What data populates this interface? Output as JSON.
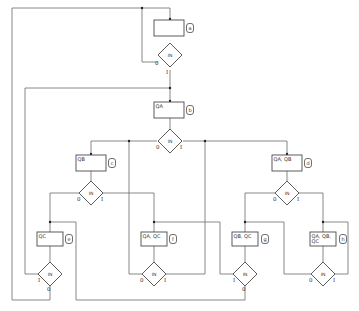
{
  "diagram": {
    "type": "ASM chart",
    "input_label": "IN",
    "states": [
      {
        "id": "a",
        "tag": "a",
        "outputs": [
          ""
        ],
        "box": [
          154,
          20,
          30,
          16
        ],
        "tagpos": [
          190,
          28
        ],
        "decision": [
          170,
          55
        ]
      },
      {
        "id": "b",
        "tag": "b",
        "outputs": [
          "QA"
        ],
        "box": [
          154,
          102,
          30,
          16
        ],
        "tagpos": [
          190,
          110
        ],
        "decision": [
          170,
          141
        ]
      },
      {
        "id": "c",
        "tag": "c",
        "outputs": [
          "QB"
        ],
        "box": [
          76,
          155,
          30,
          16
        ],
        "tagpos": [
          112,
          163
        ],
        "decision": [
          91,
          193
        ]
      },
      {
        "id": "d",
        "tag": "d",
        "outputs": [
          "QA, QB"
        ],
        "box": [
          272,
          155,
          30,
          16
        ],
        "tagpos": [
          308,
          163
        ],
        "decision": [
          287,
          193
        ]
      },
      {
        "id": "e",
        "tag": "e",
        "outputs": [
          "QC"
        ],
        "box": [
          37,
          232,
          26,
          14
        ],
        "tagpos": [
          69,
          239
        ],
        "decision": [
          50,
          274
        ]
      },
      {
        "id": "f",
        "tag": "f",
        "outputs": [
          "QA, QC"
        ],
        "box": [
          141,
          232,
          26,
          14
        ],
        "tagpos": [
          173,
          239
        ],
        "decision": [
          154,
          274
        ]
      },
      {
        "id": "g",
        "tag": "g",
        "outputs": [
          "QB, QC"
        ],
        "box": [
          232,
          232,
          26,
          14
        ],
        "tagpos": [
          265,
          239
        ],
        "decision": [
          245,
          274
        ]
      },
      {
        "id": "h",
        "tag": "h",
        "outputs": [
          "QA, QB,",
          "QC"
        ],
        "box": [
          310,
          232,
          26,
          14
        ],
        "tagpos": [
          343,
          239
        ],
        "decision": [
          323,
          274
        ]
      }
    ],
    "branch_labels": {
      "zero": "0",
      "one": "I"
    }
  }
}
